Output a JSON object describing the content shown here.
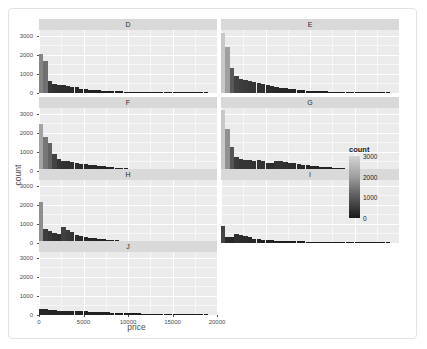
{
  "chart_data": {
    "type": "bar",
    "title": "",
    "subtitle": "",
    "xlabel": "price",
    "ylabel": "count",
    "xlim": [
      0,
      20000
    ],
    "ylim": [
      0,
      3300
    ],
    "grid": true,
    "facet_layout": "wrap",
    "facet_variable": "cut",
    "legend": {
      "title": "count",
      "position": "right",
      "type": "colorbar",
      "ticks": [
        3000,
        2000,
        1000,
        0
      ],
      "tick_labels": [
        "3000",
        "2000",
        "1000",
        "0"
      ],
      "range": [
        0,
        3000
      ],
      "low_color": "#132b43",
      "high_color": "#d8d8d8"
    },
    "x_ticks": [
      0,
      5000,
      10000,
      15000,
      20000
    ],
    "x_tick_labels": [
      "0",
      "5000",
      "10000",
      "15000",
      "20000"
    ],
    "y_ticks": [
      0,
      1000,
      2000,
      3000
    ],
    "y_tick_labels": [
      "0",
      "1000",
      "2000",
      "3000"
    ],
    "bin_width": 500,
    "panels": [
      {
        "label": "D",
        "bin_starts": [
          0,
          500,
          1000,
          1500,
          2000,
          2500,
          3000,
          3500,
          4000,
          4500,
          5000,
          5500,
          6000,
          6500,
          7000,
          7500,
          8000,
          8500,
          9000,
          9500,
          10000,
          10500,
          11000,
          11500,
          12000,
          12500,
          13000,
          13500,
          14000,
          14500,
          15000,
          15500,
          16000,
          16500,
          17000,
          17500,
          18000,
          18500
        ],
        "values": [
          2020,
          1690,
          610,
          480,
          440,
          420,
          380,
          330,
          290,
          230,
          210,
          175,
          160,
          140,
          125,
          110,
          100,
          90,
          80,
          72,
          65,
          58,
          52,
          46,
          42,
          38,
          34,
          30,
          27,
          24,
          22,
          20,
          18,
          16,
          14,
          12,
          10,
          8
        ]
      },
      {
        "label": "E",
        "bin_starts": [
          0,
          500,
          1000,
          1500,
          2000,
          2500,
          3000,
          3500,
          4000,
          4500,
          5000,
          5500,
          6000,
          6500,
          7000,
          7500,
          8000,
          8500,
          9000,
          9500,
          10000,
          10500,
          11000,
          11500,
          12000,
          12500,
          13000,
          13500,
          14000,
          14500,
          15000,
          15500,
          16000,
          16500,
          17000,
          17500,
          18000,
          18500
        ],
        "values": [
          3120,
          2400,
          1290,
          880,
          760,
          700,
          640,
          580,
          520,
          460,
          400,
          350,
          310,
          270,
          240,
          210,
          185,
          165,
          145,
          130,
          115,
          100,
          90,
          80,
          72,
          64,
          58,
          52,
          46,
          41,
          37,
          33,
          29,
          26,
          23,
          20,
          17,
          14
        ]
      },
      {
        "label": "F",
        "bin_starts": [
          0,
          500,
          1000,
          1500,
          2000,
          2500,
          3000,
          3500,
          4000,
          4500,
          5000,
          5500,
          6000,
          6500,
          7000,
          7500,
          8000,
          8500,
          9000,
          9500,
          10000,
          10500,
          11000,
          11500,
          12000,
          12500,
          13000,
          13500,
          14000,
          14500,
          15000,
          15500,
          16000,
          16500,
          17000,
          17500,
          18000,
          18500
        ],
        "values": [
          2460,
          1790,
          1450,
          900,
          620,
          540,
          500,
          460,
          420,
          380,
          350,
          320,
          290,
          265,
          240,
          215,
          195,
          175,
          158,
          142,
          128,
          115,
          103,
          92,
          82,
          73,
          65,
          58,
          52,
          46,
          41,
          36,
          32,
          28,
          25,
          22,
          19,
          16
        ]
      },
      {
        "label": "G",
        "bin_starts": [
          0,
          500,
          1000,
          1500,
          2000,
          2500,
          3000,
          3500,
          4000,
          4500,
          5000,
          5500,
          6000,
          6500,
          7000,
          7500,
          8000,
          8500,
          9000,
          9500,
          10000,
          10500,
          11000,
          11500,
          12000,
          12500,
          13000,
          13500,
          14000,
          14500,
          15000,
          15500,
          16000,
          16500,
          17000,
          17500,
          18000,
          18500
        ],
        "values": [
          3220,
          2190,
          1240,
          720,
          620,
          600,
          580,
          540,
          560,
          520,
          440,
          420,
          540,
          500,
          460,
          430,
          400,
          370,
          340,
          310,
          280,
          255,
          230,
          208,
          186,
          166,
          148,
          132,
          118,
          105,
          94,
          84,
          75,
          67,
          60,
          53,
          47,
          42
        ]
      },
      {
        "label": "H",
        "bin_starts": [
          0,
          500,
          1000,
          1500,
          2000,
          2500,
          3000,
          3500,
          4000,
          4500,
          5000,
          5500,
          6000,
          6500,
          7000,
          7500,
          8000,
          8500,
          9000,
          9500,
          10000,
          10500,
          11000,
          11500,
          12000,
          12500,
          13000,
          13500,
          14000,
          14500,
          15000,
          15500,
          16000,
          16500,
          17000,
          17500,
          18000,
          18500
        ],
        "values": [
          2150,
          760,
          640,
          500,
          460,
          830,
          700,
          560,
          420,
          350,
          300,
          270,
          240,
          210,
          190,
          170,
          155,
          140,
          128,
          116,
          105,
          95,
          86,
          78,
          70,
          63,
          57,
          51,
          46,
          41,
          37,
          33,
          29,
          26,
          23,
          20,
          18,
          15
        ]
      },
      {
        "label": "I",
        "bin_starts": [
          0,
          500,
          1000,
          1500,
          2000,
          2500,
          3000,
          3500,
          4000,
          4500,
          5000,
          5500,
          6000,
          6500,
          7000,
          7500,
          8000,
          8500,
          9000,
          9500,
          10000,
          10500,
          11000,
          11500,
          12000,
          12500,
          13000,
          13500,
          14000,
          14500,
          15000,
          15500,
          16000,
          16500,
          17000,
          17500,
          18000,
          18500
        ],
        "values": [
          910,
          330,
          290,
          450,
          420,
          380,
          290,
          230,
          190,
          165,
          150,
          140,
          130,
          120,
          112,
          104,
          96,
          90,
          84,
          78,
          72,
          67,
          62,
          57,
          53,
          49,
          45,
          41,
          38,
          35,
          32,
          29,
          27,
          24,
          22,
          20,
          18,
          16
        ]
      },
      {
        "label": "J",
        "bin_starts": [
          0,
          500,
          1000,
          1500,
          2000,
          2500,
          3000,
          3500,
          4000,
          4500,
          5000,
          5500,
          6000,
          6500,
          7000,
          7500,
          8000,
          8500,
          9000,
          9500,
          10000,
          10500,
          11000,
          11500,
          12000,
          12500,
          13000,
          13500,
          14000,
          14500,
          15000,
          15500,
          16000,
          16500,
          17000,
          17500,
          18000,
          18500
        ],
        "values": [
          310,
          290,
          250,
          240,
          235,
          230,
          225,
          215,
          205,
          195,
          185,
          175,
          165,
          155,
          145,
          136,
          127,
          119,
          111,
          104,
          97,
          90,
          84,
          78,
          72,
          67,
          62,
          57,
          53,
          49,
          45,
          41,
          38,
          35,
          32,
          29,
          26,
          24
        ]
      }
    ]
  }
}
